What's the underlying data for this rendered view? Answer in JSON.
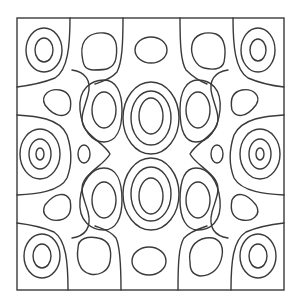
{
  "figure": {
    "type": "contour-plot",
    "line_color": "#3a3a3a",
    "background": "#ffffff",
    "frame": {
      "x": 17,
      "y": 18,
      "width": 267,
      "height": 272
    }
  }
}
